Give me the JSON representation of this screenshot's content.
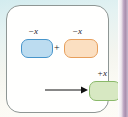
{
  "diagram": {
    "card": {
      "background_color": "#fffffe",
      "border_color": "#8e9694"
    },
    "page_background_color": "#e4f2f2",
    "edge_band_color": "#a98fae",
    "nodes": [
      {
        "id": "box-blue",
        "label": "−x",
        "label_meaning": "negative-x",
        "fill_color": "#bcdcf0",
        "border_color": "#4795cb"
      },
      {
        "id": "box-orange",
        "label": "−x",
        "label_meaning": "negative-x",
        "fill_color": "#fbdfc1",
        "border_color": "#e79f5c"
      },
      {
        "id": "box-green",
        "label": "+x",
        "label_meaning": "positive-x",
        "fill_color": "#d7e8c2",
        "border_color": "#8ab96a"
      }
    ],
    "operator": "+",
    "arrow": {
      "direction": "right",
      "color": "#111111"
    }
  }
}
